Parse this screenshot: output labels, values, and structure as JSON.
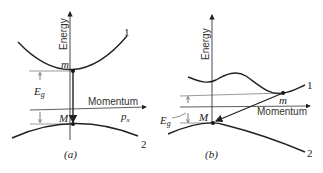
{
  "panel_a": {
    "caption": "(a)",
    "y_axis_label": "Energy",
    "x_axis_label": "Momentum",
    "x_axis_symbol": "px",
    "band_upper_label": "1",
    "band_lower_label": "2",
    "min_point_label": "m",
    "max_point_label": "M",
    "gap_label": "Eg",
    "transition": "direct (vertical)"
  },
  "panel_b": {
    "caption": "(b)",
    "y_axis_label": "Energy",
    "x_axis_label": "Momentum",
    "band_upper_label": "1",
    "band_lower_label": "2",
    "min_point_label": "m",
    "max_point_label": "M",
    "gap_label": "Eg",
    "transition": "indirect (diagonal)"
  },
  "colors": {
    "ink": "#222222",
    "thin": "#555555"
  }
}
